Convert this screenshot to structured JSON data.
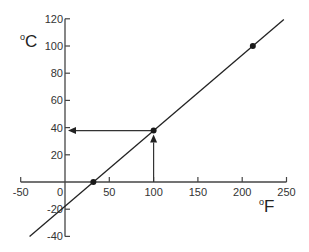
{
  "chart_data": {
    "type": "line",
    "title": "",
    "xlabel": "°F",
    "ylabel": "°C",
    "xlabel_unit": "F",
    "ylabel_unit": "C",
    "degree_symbol": "o",
    "xlim": [
      -50,
      250
    ],
    "ylim": [
      -40,
      120
    ],
    "x_ticks": [
      -50,
      0,
      50,
      100,
      150,
      200,
      250
    ],
    "y_ticks": [
      -40,
      -20,
      20,
      40,
      60,
      80,
      100,
      120
    ],
    "x_tick_labels": [
      "-50",
      "0",
      "50",
      "100",
      "150",
      "200",
      "250"
    ],
    "y_tick_labels": [
      "-40",
      "-20",
      "20",
      "40",
      "60",
      "80",
      "100",
      "120"
    ],
    "origin_label": "0",
    "grid": false,
    "legend": null,
    "series": [
      {
        "name": "Celsius vs Fahrenheit",
        "formula": "C = (F - 32) * 5/9",
        "line_x": [
          -40,
          247
        ],
        "line_y": [
          -40,
          119.4
        ],
        "color": "#222222"
      }
    ],
    "points": [
      {
        "x": 32,
        "y": 0
      },
      {
        "x": 100,
        "y": 37.8
      },
      {
        "x": 212,
        "y": 100
      }
    ],
    "annotations": [
      {
        "type": "arrow",
        "from": [
          100,
          0
        ],
        "to": [
          100,
          37.8
        ],
        "direction": "up"
      },
      {
        "type": "arrow",
        "from": [
          100,
          37.8
        ],
        "to": [
          0,
          37.8
        ],
        "direction": "left"
      }
    ]
  }
}
